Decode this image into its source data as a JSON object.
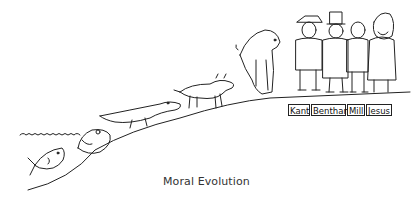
{
  "caption": "Moral Evolution",
  "nameplates": [
    "Kant",
    "Bentham",
    "Mill",
    "Jesus"
  ],
  "figures": [
    "fish",
    "frog",
    "crocodile",
    "dog",
    "ape",
    "kant",
    "bentham",
    "mill",
    "jesus"
  ]
}
